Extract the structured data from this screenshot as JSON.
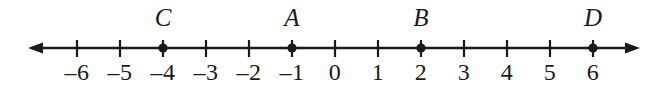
{
  "figure": {
    "background_color": "#ffffff",
    "ink_color": "#1a1a1a"
  },
  "chart_data": {
    "type": "scatter",
    "title": "",
    "xlabel": "",
    "ylabel": "",
    "orientation": "horizontal-number-line",
    "xlim": [
      -6.6,
      6.6
    ],
    "axis_arrows": [
      "left",
      "right"
    ],
    "grid": false,
    "legend": false,
    "tick_values": [
      -6,
      -5,
      -4,
      -3,
      -2,
      -1,
      0,
      1,
      2,
      3,
      4,
      5,
      6
    ],
    "tick_labels": [
      "–6",
      "–5",
      "–4",
      "–3",
      "–2",
      "–1",
      "0",
      "1",
      "2",
      "3",
      "4",
      "5",
      "6"
    ],
    "points": [
      {
        "label": "C",
        "value": -4
      },
      {
        "label": "A",
        "value": -1
      },
      {
        "label": "B",
        "value": 2
      },
      {
        "label": "D",
        "value": 6
      }
    ]
  },
  "geometry": {
    "origin_x": 335,
    "unit_px": 43,
    "axis_y": 48,
    "line_left_x": 28,
    "line_right_x": 640,
    "tick_top_y": 40,
    "tick_bottom_y": 57,
    "dot_radius": 4.6,
    "line_width": 2.6,
    "tick_width": 2.2
  }
}
